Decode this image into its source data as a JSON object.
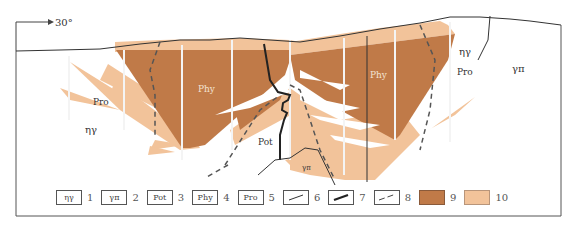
{
  "orientation": {
    "label": "30°"
  },
  "colors": {
    "unit9": "#C07A48",
    "unit10": "#F2C39A",
    "line": "#333333",
    "frame": "#555555"
  },
  "labels": {
    "pro_left": "Pro",
    "phy_left": "Phy",
    "phy_right": "Phy",
    "pro_right": "Pro",
    "ny_left": "ηγ",
    "ny_right": "ηγ",
    "ypi_right": "γπ",
    "pot": "Pot",
    "ypi_small": "γπ"
  },
  "legend": [
    {
      "symbol": "ηγ",
      "number": "1"
    },
    {
      "symbol": "γπ",
      "number": "2"
    },
    {
      "symbol": "Pot",
      "number": "3"
    },
    {
      "symbol": "Phy",
      "number": "4"
    },
    {
      "symbol": "Pro",
      "number": "5"
    },
    {
      "symbol": "thin-line",
      "number": "6"
    },
    {
      "symbol": "thick-line",
      "number": "7"
    },
    {
      "symbol": "dashed-line",
      "number": "8"
    },
    {
      "symbol": "dark-fill",
      "number": "9"
    },
    {
      "symbol": "light-fill",
      "number": "10"
    }
  ]
}
